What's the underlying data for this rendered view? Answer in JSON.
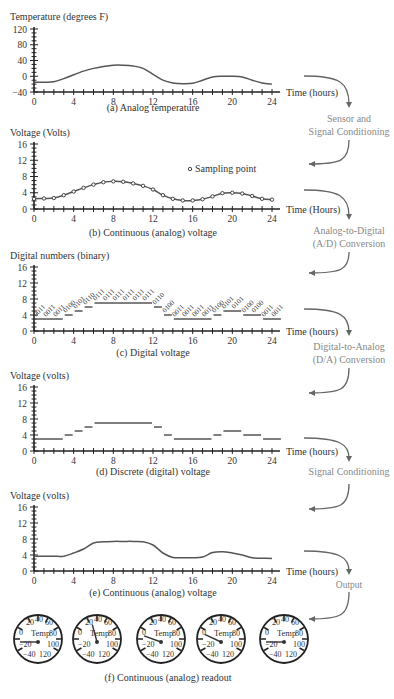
{
  "figure": {
    "panels": [
      {
        "id": "a",
        "ylabel": "Temperature (degrees F)",
        "xlabel": "Time (hours)",
        "caption": "(a) Analog temperature",
        "yticks": [
          "120",
          "80",
          "40",
          "0",
          "−40"
        ],
        "xticks": [
          "0",
          "4",
          "8",
          "12",
          "16",
          "20",
          "24"
        ]
      },
      {
        "id": "b",
        "ylabel": "Voltage (Volts)",
        "xlabel": "Time (Hours)",
        "caption": "(b) Continuous (analog) voltage",
        "yticks": [
          "16",
          "12",
          "8",
          "4",
          "0"
        ],
        "xticks": [
          "0",
          "4",
          "8",
          "12",
          "16",
          "20",
          "24"
        ],
        "legend": "Sampling point"
      },
      {
        "id": "c",
        "ylabel": "Digital numbers (binary)",
        "xlabel": "Time (hours)",
        "caption": "(c) Digital voltage",
        "yticks": [
          "16",
          "12",
          "8",
          "4",
          "0"
        ],
        "xticks": [
          "0",
          "4",
          "8",
          "12",
          "16",
          "20",
          "24"
        ]
      },
      {
        "id": "d",
        "ylabel": "Voltage (volts)",
        "xlabel": "Time (hours)",
        "caption": "(d) Discrete (digital) voltage",
        "yticks": [
          "16",
          "12",
          "8",
          "4",
          "0"
        ],
        "xticks": [
          "0",
          "4",
          "8",
          "12",
          "16",
          "20",
          "24"
        ]
      },
      {
        "id": "e",
        "ylabel": "Voltage (volts)",
        "xlabel": "Time (hours)",
        "caption": "(e) Continuous (analog) voltage",
        "yticks": [
          "16",
          "12",
          "8",
          "4",
          "0"
        ],
        "xticks": [
          "0",
          "4",
          "8",
          "12",
          "16",
          "20",
          "24"
        ]
      }
    ],
    "stages": [
      "Sensor and",
      "Signal Conditioning",
      "Analog-to-Digital",
      "(A/D) Conversion",
      "Digital-to-Analog",
      "(D/A) Conversion",
      "Signal Conditioning",
      "Output"
    ],
    "gauges": {
      "caption": "(f) Continuous (analog) readout",
      "center_label": "Temp",
      "scale": [
        "0",
        "20",
        "40",
        "60",
        "80",
        "100",
        "−20",
        "−40",
        "120"
      ],
      "needle_angles_deg": [
        180,
        255,
        200,
        205,
        180
      ]
    }
  },
  "chart_data": [
    {
      "type": "line",
      "title": "(a) Analog temperature",
      "xlabel": "Time (hours)",
      "ylabel": "Temperature (degrees F)",
      "ylim": [
        -40,
        120
      ],
      "xlim": [
        0,
        24
      ],
      "x": [
        0,
        1,
        2,
        3,
        4,
        5,
        6,
        7,
        8,
        9,
        10,
        11,
        12,
        13,
        14,
        15,
        16,
        17,
        18,
        19,
        20,
        21,
        22,
        23,
        24
      ],
      "values": [
        -15,
        -15,
        -14,
        -6,
        4,
        13,
        20,
        25,
        28,
        28,
        26,
        20,
        5,
        -10,
        -17,
        -19,
        -18,
        -10,
        -2,
        0,
        0,
        -2,
        -10,
        -17,
        -20
      ]
    },
    {
      "type": "line",
      "title": "(b) Continuous (analog) voltage",
      "xlabel": "Time (Hours)",
      "ylabel": "Voltage (Volts)",
      "ylim": [
        0,
        16
      ],
      "xlim": [
        0,
        24
      ],
      "legend": [
        "Sampling point"
      ],
      "x": [
        0,
        1,
        2,
        3,
        4,
        5,
        6,
        7,
        8,
        9,
        10,
        11,
        12,
        13,
        14,
        15,
        16,
        17,
        18,
        19,
        20,
        21,
        22,
        23,
        24
      ],
      "values": [
        2.5,
        2.6,
        2.7,
        3.4,
        4.3,
        5.2,
        6.0,
        6.6,
        6.8,
        6.7,
        6.3,
        5.7,
        4.8,
        3.4,
        2.5,
        2.1,
        2.1,
        2.4,
        3.1,
        3.9,
        4.0,
        3.8,
        3.2,
        2.5,
        2.3
      ]
    },
    {
      "type": "line",
      "title": "(c) Digital voltage",
      "xlabel": "Time (hours)",
      "ylabel": "Digital numbers (binary)",
      "ylim": [
        0,
        16
      ],
      "xlim": [
        0,
        24
      ],
      "x": [
        0,
        1,
        2,
        3,
        4,
        5,
        6,
        7,
        8,
        9,
        10,
        11,
        12,
        13,
        14,
        15,
        16,
        17,
        18,
        19,
        20,
        21,
        22,
        23,
        24
      ],
      "values": [
        3,
        3,
        3,
        4,
        5,
        6,
        7,
        7,
        7,
        7,
        7,
        7,
        6,
        4,
        3,
        3,
        3,
        3,
        4,
        5,
        5,
        4,
        4,
        3,
        3
      ],
      "labels": [
        "0011",
        "0011",
        "0011",
        "0100",
        "0101",
        "0110",
        "0111",
        "0111",
        "0111",
        "0111",
        "0111",
        "0111",
        "0110",
        "0100",
        "0011",
        "0011",
        "0011",
        "0011",
        "0100",
        "0101",
        "0101",
        "0100",
        "0100",
        "0011",
        "0011"
      ]
    },
    {
      "type": "line",
      "title": "(d) Discrete (digital) voltage",
      "xlabel": "Time (hours)",
      "ylabel": "Voltage (volts)",
      "ylim": [
        0,
        16
      ],
      "xlim": [
        0,
        24
      ],
      "x": [
        0,
        1,
        2,
        3,
        4,
        5,
        6,
        7,
        8,
        9,
        10,
        11,
        12,
        13,
        14,
        15,
        16,
        17,
        18,
        19,
        20,
        21,
        22,
        23,
        24
      ],
      "values": [
        3,
        3,
        3,
        4,
        5,
        6,
        7,
        7,
        7,
        7,
        7,
        7,
        6,
        4,
        3,
        3,
        3,
        3,
        4,
        5,
        5,
        4,
        4,
        3,
        3
      ]
    },
    {
      "type": "line",
      "title": "(e) Continuous (analog) voltage",
      "xlabel": "Time (hours)",
      "ylabel": "Voltage (volts)",
      "ylim": [
        0,
        16
      ],
      "xlim": [
        0,
        24
      ],
      "x": [
        0,
        1,
        2,
        3,
        4,
        5,
        6,
        7,
        8,
        9,
        10,
        11,
        12,
        13,
        14,
        15,
        16,
        17,
        18,
        19,
        20,
        21,
        22,
        23,
        24
      ],
      "values": [
        3.7,
        3.7,
        3.7,
        3.7,
        4.5,
        5.5,
        7.0,
        7.3,
        7.4,
        7.4,
        7.4,
        7.3,
        6.5,
        4.5,
        3.4,
        3.3,
        3.3,
        3.5,
        4.6,
        4.8,
        4.5,
        4.0,
        3.3,
        3.2,
        3.1
      ]
    }
  ]
}
